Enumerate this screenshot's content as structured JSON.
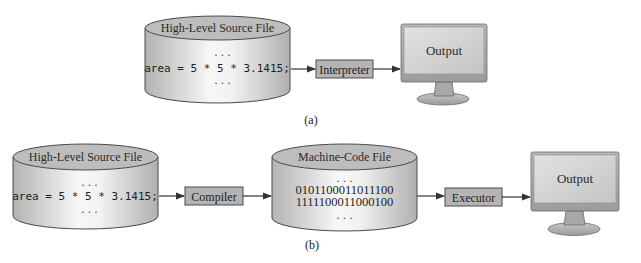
{
  "diagram_a": {
    "caption": "(a)",
    "source_file": {
      "title": "High-Level Source File",
      "dots_top": "...",
      "code": "area = 5 * 5 * 3.1415;",
      "dots_bottom": "..."
    },
    "processor": {
      "label": "Interpreter"
    },
    "output": {
      "label": "Output"
    }
  },
  "diagram_b": {
    "caption": "(b)",
    "source_file": {
      "title": "High-Level Source File",
      "dots_top": "...",
      "code": "area = 5 * 5 * 3.1415;",
      "dots_bottom": "..."
    },
    "compiler": {
      "label": "Compiler"
    },
    "machine_code_file": {
      "title": "Machine-Code File",
      "dots_top": "...",
      "line1": "0101100011011100",
      "line2": "1111100011000100",
      "dots_bottom": "..."
    },
    "executor": {
      "label": "Executor"
    },
    "output": {
      "label": "Output"
    }
  },
  "colors": {
    "cylinder_top": "#bdbdbd",
    "cylinder_body_light": "#f4f4f4",
    "cylinder_body_dark": "#b9b9b9",
    "box_fill": "#b4b4b4",
    "stroke": "#4a4a4a",
    "arrow": "#333333",
    "monitor_frame": "#a9a9a9",
    "monitor_screen": "#cfcfcf"
  }
}
